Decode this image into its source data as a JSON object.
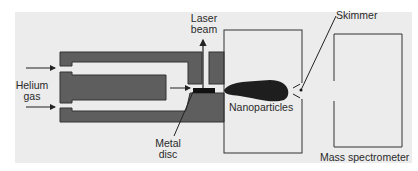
{
  "diagram": {
    "type": "apparatus-schematic",
    "colors": {
      "background": "#ececec",
      "block_fill": "#5e5e5e",
      "block_stroke": "#333333",
      "disc": "#111111",
      "plume": "#1e1e1e",
      "line": "#222222"
    },
    "labels": {
      "helium_gas": {
        "line1": "Helium",
        "line2": "gas"
      },
      "laser_beam": {
        "line1": "Laser",
        "line2": "beam"
      },
      "metal_disc": {
        "line1": "Metal",
        "line2": "disc"
      },
      "nanoparticles": "Nanoparticles",
      "skimmer": "Skimmer",
      "mass_spectrometer": "Mass spectrometer"
    },
    "nodes": [
      "Helium gas inlet",
      "Gas flow channel block",
      "Laser beam",
      "Metal disc",
      "Expansion chamber",
      "Nanoparticle plume",
      "Skimmer",
      "Mass spectrometer"
    ],
    "edges": [
      {
        "from": "Helium gas inlet",
        "to": "Gas flow channel block",
        "label": "helium flow"
      },
      {
        "from": "Gas flow channel block",
        "to": "Metal disc",
        "label": "gas flow"
      },
      {
        "from": "Laser beam",
        "to": "Metal disc",
        "label": "ablation"
      },
      {
        "from": "Metal disc",
        "to": "Nanoparticle plume"
      },
      {
        "from": "Nanoparticle plume",
        "to": "Skimmer"
      },
      {
        "from": "Skimmer",
        "to": "Mass spectrometer"
      }
    ]
  }
}
